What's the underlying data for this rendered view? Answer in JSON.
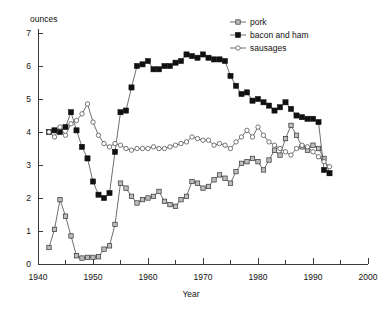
{
  "chart_data": {
    "type": "line",
    "title": "",
    "xlabel": "Year",
    "ylabel": "ounces",
    "xlim": [
      1940,
      2000
    ],
    "ylim": [
      0,
      7
    ],
    "xticks": [
      1940,
      1950,
      1960,
      1970,
      1980,
      1990,
      2000
    ],
    "xticklabels": [
      "1940",
      "1950",
      "1960",
      "1970",
      "1980",
      "1990",
      "2000"
    ],
    "xminorticks": [
      1945,
      1955,
      1965,
      1975,
      1985,
      1995
    ],
    "yticks": [
      0,
      1,
      2,
      3,
      4,
      5,
      6,
      7
    ],
    "yticklabels": [
      "0",
      "1",
      "2",
      "3",
      "4",
      "5",
      "6",
      "7"
    ],
    "grid": false,
    "legend_position": "top-right",
    "legend": [
      "pork",
      "bacon and ham",
      "sausages"
    ],
    "x": [
      1942,
      1943,
      1944,
      1945,
      1946,
      1947,
      1948,
      1949,
      1950,
      1951,
      1952,
      1953,
      1954,
      1955,
      1956,
      1957,
      1958,
      1959,
      1960,
      1961,
      1962,
      1963,
      1964,
      1965,
      1966,
      1967,
      1968,
      1969,
      1970,
      1971,
      1972,
      1973,
      1974,
      1975,
      1976,
      1977,
      1978,
      1979,
      1980,
      1981,
      1982,
      1983,
      1984,
      1985,
      1986,
      1987,
      1988,
      1989,
      1990,
      1991,
      1992,
      1993
    ],
    "series": [
      {
        "name": "pork",
        "marker": "hatched-square",
        "values": [
          0.5,
          1.05,
          1.95,
          1.45,
          0.85,
          0.25,
          0.18,
          0.2,
          0.2,
          0.22,
          0.45,
          0.55,
          1.2,
          2.45,
          2.3,
          2.05,
          1.85,
          1.95,
          2.0,
          2.05,
          2.2,
          1.9,
          1.8,
          1.75,
          1.95,
          2.05,
          2.5,
          2.45,
          2.3,
          2.35,
          2.55,
          2.7,
          2.6,
          2.45,
          2.8,
          3.05,
          3.1,
          3.2,
          3.1,
          2.85,
          3.15,
          3.45,
          3.3,
          3.8,
          4.2,
          3.9,
          3.55,
          3.45,
          3.6,
          3.5,
          3.2,
          2.75
        ]
      },
      {
        "name": "bacon and ham",
        "marker": "filled-square",
        "values": [
          4.0,
          4.05,
          4.0,
          4.15,
          4.6,
          4.05,
          3.55,
          3.2,
          2.5,
          2.1,
          2.0,
          2.15,
          3.4,
          4.6,
          4.65,
          5.35,
          6.0,
          6.05,
          6.15,
          5.9,
          5.9,
          6.0,
          6.0,
          6.1,
          6.15,
          6.35,
          6.3,
          6.25,
          6.35,
          6.25,
          6.2,
          6.2,
          6.15,
          5.7,
          5.4,
          5.15,
          5.2,
          4.95,
          5.0,
          4.9,
          4.8,
          4.65,
          4.75,
          4.9,
          4.7,
          4.5,
          4.45,
          4.4,
          4.4,
          4.3,
          2.85,
          2.75
        ]
      },
      {
        "name": "sausages",
        "marker": "open-circle",
        "values": [
          4.0,
          3.85,
          4.15,
          3.9,
          4.25,
          4.35,
          4.55,
          4.85,
          4.3,
          3.9,
          3.65,
          3.55,
          3.65,
          3.6,
          3.5,
          3.45,
          3.5,
          3.5,
          3.5,
          3.55,
          3.5,
          3.5,
          3.55,
          3.6,
          3.65,
          3.7,
          3.85,
          3.8,
          3.75,
          3.75,
          3.6,
          3.65,
          3.6,
          3.5,
          3.7,
          3.85,
          4.05,
          3.85,
          4.15,
          3.9,
          3.7,
          3.6,
          3.5,
          3.4,
          3.3,
          3.5,
          3.6,
          3.55,
          3.4,
          3.25,
          3.1,
          2.95
        ]
      }
    ]
  }
}
